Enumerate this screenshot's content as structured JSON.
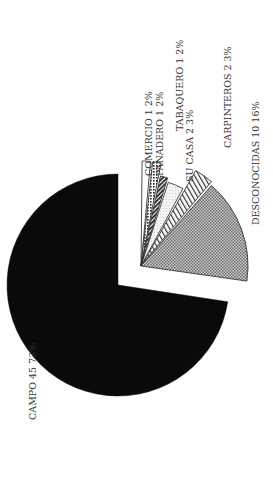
{
  "chart_data": {
    "type": "pie",
    "title": "",
    "orientation": "rotated 90deg counter-clockwise (labels read bottom-to-top)",
    "exploded": [
      "COMERCIO",
      "PANADERO",
      "TABAQUERO",
      "SU CASA",
      "CARPINTEROS",
      "DESCONOCIDAS"
    ],
    "slices": [
      {
        "label": "CAMPO",
        "value": 45,
        "percent": 73,
        "fill": "solid-black"
      },
      {
        "label": "COMERCIO",
        "value": 1,
        "percent": 2,
        "fill": "white"
      },
      {
        "label": "PANADERO",
        "value": 1,
        "percent": 2,
        "fill": "dots"
      },
      {
        "label": "TABAQUERO",
        "value": 1,
        "percent": 2,
        "fill": "dense-diagonal-hatch"
      },
      {
        "label": "SU CASA",
        "value": 2,
        "percent": 3,
        "fill": "light-stipple"
      },
      {
        "label": "CARPINTEROS",
        "value": 2,
        "percent": 3,
        "fill": "diagonal-hatch"
      },
      {
        "label": "DESCONOCIDAS",
        "value": 10,
        "percent": 16,
        "fill": "crosshatch-gray"
      }
    ],
    "total": 62
  },
  "labels": {
    "campo": "CAMPO 45 73%",
    "comercio": "COMERCIO 1 2%",
    "panadero": "PANADERO 1 2%",
    "tabaquero": "TABAQUERO 1 2%",
    "su_casa": "SU CASA 2 3%",
    "carpinteros": "CARPINTEROS 2 3%",
    "desconocidas": "DESCONOCIDAS 10 16%"
  },
  "colors": {
    "campo": "#0a0a0a",
    "stroke": "#222222",
    "text": "#333333",
    "background": "#ffffff"
  }
}
